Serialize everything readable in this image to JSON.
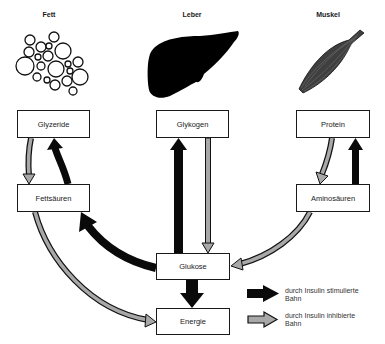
{
  "organs": {
    "fat": {
      "label": "Fett",
      "icon": "fat-cells-icon"
    },
    "liver": {
      "label": "Leber",
      "icon": "liver-icon"
    },
    "muscle": {
      "label": "Muskel",
      "icon": "muscle-icon"
    }
  },
  "nodes": {
    "glyzeride": "Glyzeride",
    "glykogen": "Glykogen",
    "protein": "Protein",
    "fettsaeuren": "Fettsäuren",
    "aminosaeuren": "Aminosäuren",
    "glukose": "Glukose",
    "energie": "Energie"
  },
  "edges": [
    {
      "from": "Glyzeride",
      "to": "Fettsäuren",
      "type": "inhibited"
    },
    {
      "from": "Fettsäuren",
      "to": "Glyzeride",
      "type": "stimulated"
    },
    {
      "from": "Glukose",
      "to": "Fettsäuren",
      "type": "stimulated"
    },
    {
      "from": "Fettsäuren",
      "to": "Energie",
      "type": "inhibited"
    },
    {
      "from": "Glukose",
      "to": "Glykogen",
      "type": "stimulated"
    },
    {
      "from": "Glykogen",
      "to": "Glukose",
      "type": "inhibited"
    },
    {
      "from": "Protein",
      "to": "Aminosäuren",
      "type": "inhibited"
    },
    {
      "from": "Aminosäuren",
      "to": "Protein",
      "type": "stimulated"
    },
    {
      "from": "Aminosäuren",
      "to": "Glukose",
      "type": "inhibited"
    },
    {
      "from": "Glukose",
      "to": "Energie",
      "type": "stimulated"
    }
  ],
  "legend": {
    "stimulated": "durch Insulin stimulierte Bahn",
    "inhibited": "durch Insulin inhibierte Bahn"
  },
  "colors": {
    "stimulated": "#0a0a0a",
    "inhibited": "#a8a8a8",
    "outline": "#1a1a1a",
    "muscle": "#4a4a4a"
  }
}
